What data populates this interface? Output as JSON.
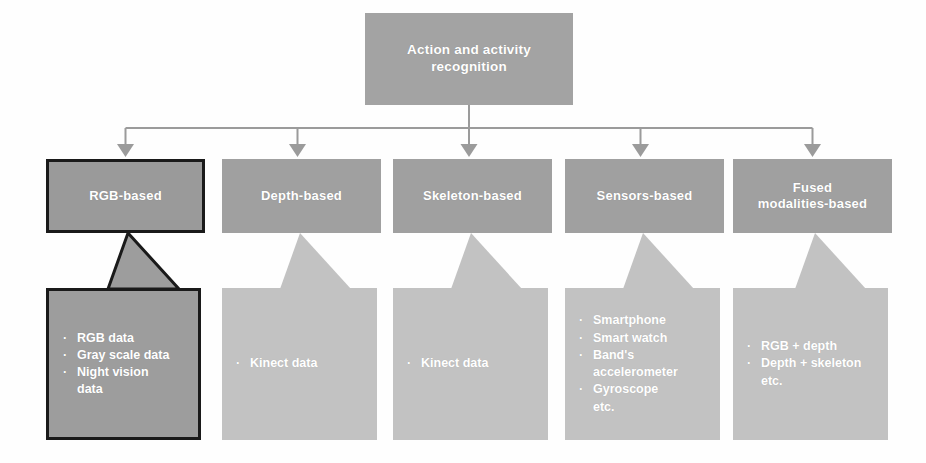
{
  "diagram": {
    "title_node": {
      "label": "Action and activity\nrecognition"
    },
    "bullet_glyph": "·",
    "colors": {
      "root_fill": "#a3a3a3",
      "category_fill": "#a0a0a0",
      "category_highlight_fill": "#9a9a9a",
      "content_fill": "#c2c2c2",
      "content_highlight_fill": "#9d9d9d",
      "highlight_border": "#1a1a1a",
      "connector_line": "#9b9b9b",
      "text": "#ffffff"
    },
    "columns": [
      {
        "id": "rgb-based",
        "label": "RGB-based",
        "highlighted": true,
        "items": [
          "RGB data",
          "Gray scale data",
          "Night vision\ndata"
        ]
      },
      {
        "id": "depth-based",
        "label": "Depth-based",
        "highlighted": false,
        "items": [
          "Kinect data"
        ]
      },
      {
        "id": "skeleton-based",
        "label": "Skeleton-based",
        "highlighted": false,
        "items": [
          "Kinect data"
        ]
      },
      {
        "id": "sensors-based",
        "label": "Sensors-based",
        "highlighted": false,
        "items": [
          "Smartphone",
          "Smart watch",
          "Band's\naccelerometer",
          "Gyroscope",
          "etc."
        ]
      },
      {
        "id": "fused-modalities-based",
        "label": "Fused\nmodalities-based",
        "highlighted": false,
        "items": [
          "RGB + depth",
          "Depth + skeleton",
          "etc."
        ]
      }
    ]
  }
}
